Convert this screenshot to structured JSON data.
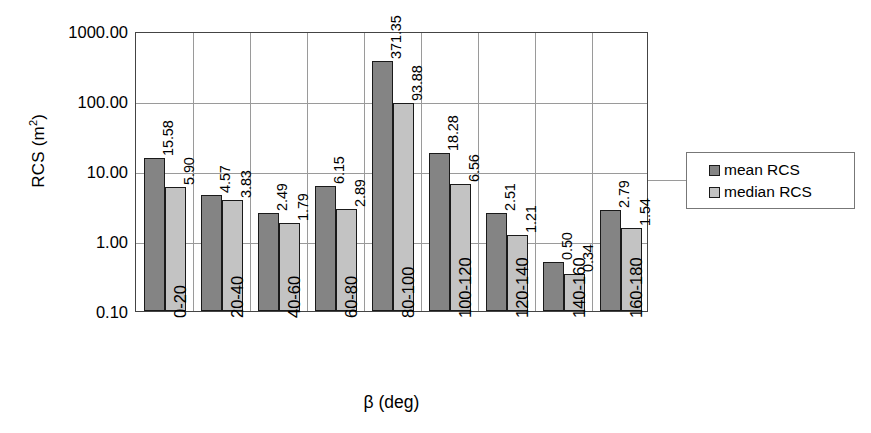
{
  "chart_data": {
    "type": "bar",
    "title": "",
    "xlabel": "β (deg)",
    "ylabel": "RCS (m²)",
    "ylabel_text": "RCS (m",
    "ylabel_sup": "2",
    "ylabel_close": ")",
    "yscale": "log",
    "ylim": [
      0.1,
      1000.0
    ],
    "ytick_labels": [
      "1000.00",
      "100.00",
      "10.00",
      "1.00",
      "0.10"
    ],
    "ytick_values": [
      1000.0,
      100.0,
      10.0,
      1.0,
      0.1
    ],
    "grid": true,
    "legend_position": "right",
    "categories": [
      "0-20",
      "20-40",
      "40-60",
      "60-80",
      "80-100",
      "100-120",
      "120-140",
      "140-160",
      "160-180"
    ],
    "series": [
      {
        "name": "mean RCS",
        "color": "#848484",
        "values": [
          15.58,
          4.57,
          2.49,
          6.15,
          371.35,
          18.28,
          2.51,
          0.5,
          2.79
        ],
        "labels": [
          "15.58",
          "4.57",
          "2.49",
          "6.15",
          "371.35",
          "18.28",
          "2.51",
          "0.50",
          "2.79"
        ]
      },
      {
        "name": "median RCS",
        "color": "#c3c3c3",
        "values": [
          5.9,
          3.83,
          1.79,
          2.89,
          93.88,
          6.56,
          1.21,
          0.34,
          1.54
        ],
        "labels": [
          "5.90",
          "3.83",
          "1.79",
          "2.89",
          "93.88",
          "6.56",
          "1.21",
          "0.34",
          "1.54"
        ]
      }
    ]
  },
  "legend": {
    "entries": [
      {
        "label": "mean RCS",
        "swatch": "mean"
      },
      {
        "label": "median RCS",
        "swatch": "median"
      }
    ]
  }
}
